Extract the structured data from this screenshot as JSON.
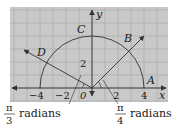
{
  "figure": {
    "grid": {
      "background": "#c9c9c9",
      "line_color": "#a8a8a8",
      "cell_px": 13,
      "x0": 10,
      "y0": 7,
      "x1": 168,
      "y1": 102
    },
    "axes": {
      "x_label": "x",
      "y_label": "y",
      "origin_label": "0",
      "x_ticks": [
        "−4",
        "−2",
        "2",
        "4"
      ],
      "y_ticks": [
        "2"
      ]
    },
    "circle": {
      "radius_units": 4,
      "stroke": "#333333"
    },
    "points": {
      "A": "A",
      "B": "B",
      "C": "C",
      "D": "D"
    },
    "angles": {
      "left": {
        "num": "π",
        "den": "3",
        "unit": "radians"
      },
      "right": {
        "num": "π",
        "den": "4",
        "unit": "radians"
      }
    }
  }
}
